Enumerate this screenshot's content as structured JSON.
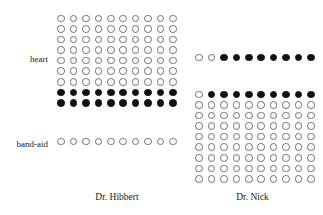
{
  "figure": {
    "title": "",
    "row_labels": [
      {
        "id": "heart",
        "text": "heart"
      },
      {
        "id": "band-aid",
        "text": "band-aid"
      }
    ],
    "group_captions": [
      {
        "id": "hibbert",
        "text": "Dr. Hibbert"
      },
      {
        "id": "nick",
        "text": "Dr. Nick"
      }
    ],
    "colors": {
      "filled": "#111111",
      "empty_outline": "#6f6f6f",
      "background": "#ffffff",
      "text": "#1a1a1a"
    }
  },
  "chart_data": {
    "type": "table",
    "subtype": "waffle-dot-matrix",
    "title": "",
    "xlabel": "",
    "ylabel": "",
    "legend": [
      {
        "label": "filled dot",
        "color": "#111111",
        "meaning": "counted unit"
      },
      {
        "label": "open dot",
        "color": "#6f6f6f",
        "meaning": "uncounted unit"
      }
    ],
    "columns": [
      "Dr. Hibbert",
      "Dr. Nick"
    ],
    "rows": [
      "heart",
      "band-aid"
    ],
    "dots_per_row": 10,
    "cells": [
      {
        "row": "heart",
        "column": "Dr. Hibbert",
        "grid_rows": 9,
        "grid_cols": 10,
        "total_dots": 90,
        "filled_dots": 20,
        "fraction": 0.2222,
        "fill_pattern": "bottom-2-rows",
        "rows_filled_flags": [
          [
            0,
            0,
            0,
            0,
            0,
            0,
            0,
            0,
            0,
            0
          ],
          [
            0,
            0,
            0,
            0,
            0,
            0,
            0,
            0,
            0,
            0
          ],
          [
            0,
            0,
            0,
            0,
            0,
            0,
            0,
            0,
            0,
            0
          ],
          [
            0,
            0,
            0,
            0,
            0,
            0,
            0,
            0,
            0,
            0
          ],
          [
            0,
            0,
            0,
            0,
            0,
            0,
            0,
            0,
            0,
            0
          ],
          [
            0,
            0,
            0,
            0,
            0,
            0,
            0,
            0,
            0,
            0
          ],
          [
            0,
            0,
            0,
            0,
            0,
            0,
            0,
            0,
            0,
            0
          ],
          [
            1,
            1,
            1,
            1,
            1,
            1,
            1,
            1,
            1,
            1
          ],
          [
            1,
            1,
            1,
            1,
            1,
            1,
            1,
            1,
            1,
            1
          ]
        ]
      },
      {
        "row": "band-aid",
        "column": "Dr. Hibbert",
        "grid_rows": 1,
        "grid_cols": 10,
        "total_dots": 10,
        "filled_dots": 0,
        "fraction": 0.0,
        "fill_pattern": "none",
        "rows_filled_flags": [
          [
            0,
            0,
            0,
            0,
            0,
            0,
            0,
            0,
            0,
            0
          ]
        ]
      },
      {
        "row": "heart",
        "column": "Dr. Nick",
        "grid_rows": 1,
        "grid_cols": 10,
        "total_dots": 10,
        "filled_dots": 8,
        "fraction": 0.8,
        "fill_pattern": "last-8-of-row",
        "rows_filled_flags": [
          [
            0,
            0,
            1,
            1,
            1,
            1,
            1,
            1,
            1,
            1
          ]
        ]
      },
      {
        "row": "band-aid",
        "column": "Dr. Nick",
        "grid_rows": 9,
        "grid_cols": 10,
        "total_dots": 90,
        "filled_dots": 9,
        "fraction": 0.1,
        "fill_pattern": "top-row-last-9",
        "rows_filled_flags": [
          [
            0,
            1,
            1,
            1,
            1,
            1,
            1,
            1,
            1,
            1
          ],
          [
            0,
            0,
            0,
            0,
            0,
            0,
            0,
            0,
            0,
            0
          ],
          [
            0,
            0,
            0,
            0,
            0,
            0,
            0,
            0,
            0,
            0
          ],
          [
            0,
            0,
            0,
            0,
            0,
            0,
            0,
            0,
            0,
            0
          ],
          [
            0,
            0,
            0,
            0,
            0,
            0,
            0,
            0,
            0,
            0
          ],
          [
            0,
            0,
            0,
            0,
            0,
            0,
            0,
            0,
            0,
            0
          ],
          [
            0,
            0,
            0,
            0,
            0,
            0,
            0,
            0,
            0,
            0
          ],
          [
            0,
            0,
            0,
            0,
            0,
            0,
            0,
            0,
            0,
            0
          ],
          [
            0,
            0,
            0,
            0,
            0,
            0,
            0,
            0,
            0,
            0
          ]
        ]
      }
    ]
  }
}
